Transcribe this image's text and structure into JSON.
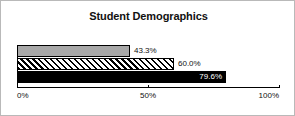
{
  "chart_data": {
    "type": "bar",
    "orientation": "horizontal",
    "title": "Student Demographics",
    "xlabel": "",
    "ylabel": "",
    "xlim": [
      0,
      100
    ],
    "grid": false,
    "legend": false,
    "categories": [
      "Series 1",
      "Series 2",
      "Series 3"
    ],
    "values": [
      43.3,
      60.0,
      79.6
    ],
    "data_labels": [
      "43.3%",
      "60.0%",
      "79.6%"
    ],
    "bar_styles": [
      "solid-gray",
      "diagonal-hatch",
      "solid-black"
    ],
    "tick_values": [
      0,
      50,
      100
    ],
    "tick_labels": [
      "0%",
      "50%",
      "100%"
    ]
  },
  "colors": {
    "bar_gray": "#a8a8a8",
    "bar_black": "#000000",
    "axis": "#000000",
    "frame": "#b9b9b9",
    "text": "#111111",
    "inverse_text": "#ffffff"
  }
}
